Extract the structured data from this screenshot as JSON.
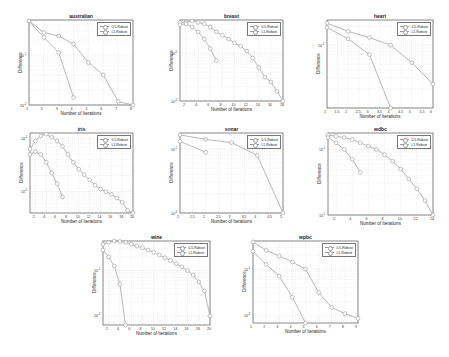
{
  "figure": {
    "legend_labels": [
      "0.5-Robust",
      "L1-Robust"
    ],
    "xlabel": "Number of Iterations",
    "ylabel": "Difference",
    "colors": {
      "line": "#9a9a9a",
      "grid": "#d6d6d6",
      "frame": "#555555",
      "background": "#ffffff"
    }
  },
  "chart_data": [
    {
      "type": "line",
      "title": "australian",
      "xlabel": "Number of Iterations",
      "ylabel": "Difference",
      "yscale": "log",
      "xlim": [
        1,
        8
      ],
      "ylim_exp": [
        -2,
        -0.3
      ],
      "xticks": [
        "1",
        "2",
        "3",
        "4",
        "5",
        "6",
        "7",
        "8"
      ],
      "yticks": [
        {
          "exp": -1,
          "label": "10^-1"
        },
        {
          "exp": -2,
          "label": "10^-2"
        }
      ],
      "series": [
        {
          "name": "0.5-Robust",
          "x": [
            1,
            2,
            3,
            4,
            5,
            6,
            7,
            8
          ],
          "y_exp": [
            -0.32,
            -0.55,
            -0.62,
            -0.78,
            -1.15,
            -1.4,
            -1.93,
            -2.0
          ]
        },
        {
          "name": "L1-Robust",
          "x": [
            1,
            2,
            3,
            4
          ],
          "y_exp": [
            -0.32,
            -0.65,
            -0.95,
            -1.85
          ]
        }
      ],
      "box": {
        "left": 29,
        "top": 20,
        "width": 104,
        "height": 85
      }
    },
    {
      "type": "line",
      "title": "breast",
      "xlabel": "Number of Iterations",
      "ylabel": "Difference",
      "yscale": "log",
      "xlim": [
        1,
        18
      ],
      "ylim_exp": [
        -2,
        -0.3
      ],
      "xticks": [
        "2",
        "4",
        "6",
        "8",
        "10",
        "12",
        "14",
        "16",
        "18"
      ],
      "yticks": [
        {
          "exp": -1,
          "label": "10^-1"
        },
        {
          "exp": -2,
          "label": "10^-2"
        }
      ],
      "series": [
        {
          "name": "0.5-Robust",
          "x": [
            1,
            2,
            3,
            4,
            5,
            6,
            7,
            8,
            9,
            10,
            11,
            12,
            13,
            14,
            15,
            16,
            17,
            18
          ],
          "y_exp": [
            -0.35,
            -0.35,
            -0.32,
            -0.35,
            -0.38,
            -0.45,
            -0.55,
            -0.62,
            -0.7,
            -0.78,
            -0.85,
            -0.95,
            -1.1,
            -1.3,
            -1.5,
            -1.6,
            -1.8,
            -2.0
          ]
        },
        {
          "name": "L1-Robust",
          "x": [
            1,
            2,
            3,
            4,
            5,
            6,
            7
          ],
          "y_exp": [
            -0.4,
            -0.38,
            -0.45,
            -0.55,
            -0.7,
            -0.9,
            -1.15
          ]
        }
      ],
      "box": {
        "left": 180,
        "top": 20,
        "width": 103,
        "height": 81
      }
    },
    {
      "type": "line",
      "title": "heart",
      "xlabel": "Number of Iterations",
      "ylabel": "Difference",
      "yscale": "log",
      "xlim": [
        1,
        6
      ],
      "ylim_exp": [
        -2,
        -0.6
      ],
      "xticks": [
        "1",
        "1.5",
        "2",
        "2.5",
        "3",
        "3.5",
        "4",
        "4.5",
        "5",
        "5.5",
        "6"
      ],
      "yticks": [
        {
          "exp": -1,
          "label": "10^-1"
        }
      ],
      "series": [
        {
          "name": "0.5-Robust",
          "x": [
            1,
            2,
            3,
            4,
            5,
            6
          ],
          "y_exp": [
            -0.65,
            -0.78,
            -0.88,
            -1.0,
            -1.28,
            -1.62
          ]
        },
        {
          "name": "L1-Robust",
          "x": [
            1,
            2,
            3,
            4
          ],
          "y_exp": [
            -0.72,
            -0.9,
            -1.15,
            -2.0
          ]
        }
      ],
      "box": {
        "left": 327,
        "top": 20,
        "width": 106,
        "height": 88
      }
    },
    {
      "type": "line",
      "title": "iris",
      "xlabel": "Number of Iterations",
      "ylabel": "Difference",
      "yscale": "log",
      "xlim": [
        1,
        20
      ],
      "ylim_exp": [
        -2.4,
        -0.9
      ],
      "xticks": [
        "2",
        "4",
        "6",
        "8",
        "10",
        "12",
        "14",
        "16",
        "18",
        "20"
      ],
      "yticks": [
        {
          "exp": -1,
          "label": "10^-1"
        },
        {
          "exp": -2,
          "label": "10^-2"
        }
      ],
      "series": [
        {
          "name": "0.5-Robust",
          "x": [
            1,
            2,
            3,
            4,
            5,
            6,
            7,
            8,
            9,
            10,
            11,
            12,
            13,
            14,
            15,
            16,
            17,
            18,
            19,
            20
          ],
          "y_exp": [
            -1.2,
            -1.05,
            -0.95,
            -0.92,
            -0.98,
            -1.05,
            -1.15,
            -1.3,
            -1.45,
            -1.58,
            -1.68,
            -1.78,
            -1.88,
            -1.95,
            -2.0,
            -2.05,
            -2.12,
            -2.2,
            -2.35,
            -2.4
          ]
        },
        {
          "name": "L1-Robust",
          "x": [
            1,
            2,
            3,
            4,
            5,
            6,
            7
          ],
          "y_exp": [
            -1.3,
            -1.25,
            -1.3,
            -1.45,
            -1.65,
            -1.85,
            -2.1
          ]
        }
      ],
      "box": {
        "left": 30,
        "top": 133,
        "width": 103,
        "height": 80
      }
    },
    {
      "type": "line",
      "title": "sonar",
      "xlabel": "Number of Iterations",
      "ylabel": "Difference",
      "yscale": "log",
      "xlim": [
        1,
        5
      ],
      "ylim_exp": [
        -2,
        -0.75
      ],
      "xticks": [
        "1",
        "1.5",
        "2",
        "2.5",
        "3",
        "3.5",
        "4",
        "4.5",
        "5"
      ],
      "yticks": [
        {
          "exp": -1,
          "label": "10^-1"
        },
        {
          "exp": -2,
          "label": "10^-2"
        }
      ],
      "series": [
        {
          "name": "0.5-Robust",
          "x": [
            1,
            2,
            3,
            4,
            5
          ],
          "y_exp": [
            -0.78,
            -0.85,
            -0.9,
            -1.1,
            -2.0
          ]
        },
        {
          "name": "L1-Robust",
          "x": [
            1,
            2
          ],
          "y_exp": [
            -0.88,
            -1.05
          ]
        }
      ],
      "box": {
        "left": 180,
        "top": 133,
        "width": 103,
        "height": 80
      }
    },
    {
      "type": "line",
      "title": "wdbc",
      "xlabel": "Number of Iterations",
      "ylabel": "Difference",
      "yscale": "log",
      "xlim": [
        1,
        14
      ],
      "ylim_exp": [
        -2,
        -0.75
      ],
      "xticks": [
        "2",
        "4",
        "6",
        "8",
        "10",
        "12",
        "14"
      ],
      "yticks": [
        {
          "exp": -1,
          "label": "10^-1"
        },
        {
          "exp": -2,
          "label": "10^-2"
        }
      ],
      "series": [
        {
          "name": "0.5-Robust",
          "x": [
            1,
            2,
            3,
            4,
            5,
            6,
            7,
            8,
            9,
            10,
            11,
            12,
            13,
            14
          ],
          "y_exp": [
            -0.78,
            -0.8,
            -0.82,
            -0.85,
            -0.9,
            -0.95,
            -1.0,
            -1.08,
            -1.18,
            -1.3,
            -1.45,
            -1.6,
            -1.78,
            -2.0
          ]
        },
        {
          "name": "L1-Robust",
          "x": [
            1,
            2,
            3,
            4,
            5
          ],
          "y_exp": [
            -0.82,
            -0.9,
            -1.0,
            -1.15,
            -1.35
          ]
        }
      ],
      "box": {
        "left": 328,
        "top": 133,
        "width": 105,
        "height": 82
      }
    },
    {
      "type": "line",
      "title": "wine",
      "xlabel": "Number of Iterations",
      "ylabel": "Difference",
      "yscale": "log",
      "xlim": [
        1,
        20
      ],
      "ylim_exp": [
        -2.2,
        -0.35
      ],
      "xticks": [
        "2",
        "4",
        "6",
        "8",
        "10",
        "12",
        "14",
        "16",
        "18",
        "20"
      ],
      "yticks": [
        {
          "exp": -1,
          "label": "10^-1"
        },
        {
          "exp": -2,
          "label": "10^-2"
        }
      ],
      "series": [
        {
          "name": "0.5-Robust",
          "x": [
            1,
            2,
            3,
            4,
            5,
            6,
            7,
            8,
            9,
            10,
            11,
            12,
            13,
            14,
            15,
            16,
            17,
            18,
            19,
            20
          ],
          "y_exp": [
            -0.42,
            -0.38,
            -0.35,
            -0.36,
            -0.38,
            -0.42,
            -0.46,
            -0.5,
            -0.55,
            -0.6,
            -0.66,
            -0.72,
            -0.78,
            -0.85,
            -0.92,
            -1.0,
            -1.1,
            -1.25,
            -1.45,
            -2.0
          ]
        },
        {
          "name": "L1-Robust",
          "x": [
            1,
            2,
            3,
            4,
            5
          ],
          "y_exp": [
            -0.55,
            -0.7,
            -0.9,
            -1.3,
            -2.2
          ]
        }
      ],
      "box": {
        "left": 103,
        "top": 241,
        "width": 107,
        "height": 84
      }
    },
    {
      "type": "line",
      "title": "wpbc",
      "xlabel": "Number of Iterations",
      "ylabel": "Difference",
      "yscale": "log",
      "xlim": [
        1,
        9
      ],
      "ylim_exp": [
        -2.15,
        -0.4
      ],
      "xticks": [
        "1",
        "2",
        "3",
        "4",
        "5",
        "6",
        "7",
        "8",
        "9"
      ],
      "yticks": [
        {
          "exp": -1,
          "label": "10^-1"
        },
        {
          "exp": -2,
          "label": "10^-2"
        }
      ],
      "series": [
        {
          "name": "0.5-Robust",
          "x": [
            1,
            2,
            3,
            4,
            5,
            6,
            7,
            8,
            9
          ],
          "y_exp": [
            -0.42,
            -0.6,
            -0.72,
            -0.85,
            -1.0,
            -1.5,
            -1.82,
            -1.95,
            -2.05
          ]
        },
        {
          "name": "L1-Robust",
          "x": [
            1,
            2,
            3,
            4,
            5
          ],
          "y_exp": [
            -0.62,
            -0.9,
            -1.15,
            -1.6,
            -2.15
          ]
        }
      ],
      "box": {
        "left": 253,
        "top": 241,
        "width": 105,
        "height": 82
      }
    }
  ]
}
